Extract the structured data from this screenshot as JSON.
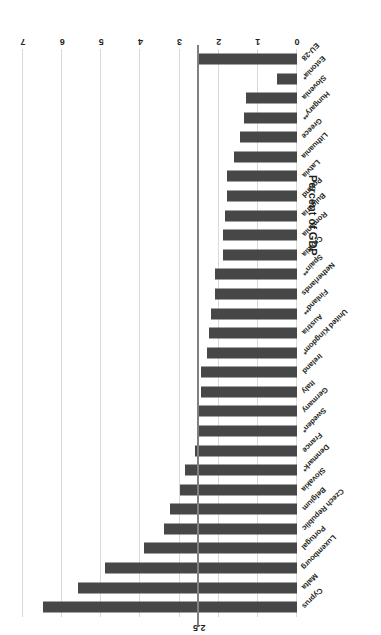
{
  "chart_data": {
    "type": "bar",
    "orientation": "horizontal",
    "title": "",
    "xlabel": "Percent of GDP",
    "ylabel": "",
    "xlim": [
      0,
      7
    ],
    "xticks": [
      "0",
      "1",
      "2",
      "3",
      "4",
      "5",
      "6",
      "7"
    ],
    "grid": true,
    "legend": null,
    "bar_color": "#474747",
    "gridline_color": "#d9d9d9",
    "reference_line": {
      "label": "2.5",
      "value": 2.5,
      "color": "#808080"
    },
    "categories": [
      "Cyprus",
      "Malta",
      "Luxembourg",
      "Portugal",
      "Czech Republic",
      "Belgium",
      "Slovakia",
      "Denmark*",
      "France",
      "Sweden*",
      "Germany",
      "Italy",
      "Ireland",
      "United Kingdom*",
      "Austria",
      "Finland**",
      "Netherlands",
      "Spain**",
      "Croatia",
      "Romania",
      "Bulgaria",
      "Poland",
      "Latvia",
      "Lithuania",
      "Greece",
      "Hungary**",
      "Slovenia",
      "Estonia*",
      "EU-28"
    ],
    "values": [
      6.5,
      5.6,
      4.9,
      3.9,
      3.4,
      3.25,
      3.0,
      2.85,
      2.6,
      2.55,
      2.5,
      2.45,
      2.45,
      2.3,
      2.25,
      2.2,
      2.1,
      2.1,
      1.9,
      1.9,
      1.85,
      1.8,
      1.8,
      1.6,
      1.45,
      1.35,
      1.3,
      0.5,
      2.5
    ]
  }
}
